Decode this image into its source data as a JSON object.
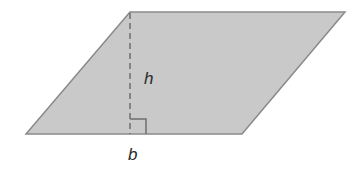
{
  "diagram": {
    "shape": "parallelogram",
    "vertices": [
      [
        130,
        12
      ],
      [
        345,
        12
      ],
      [
        242,
        134
      ],
      [
        26,
        134
      ]
    ],
    "fill_color": "#c9c9c9",
    "stroke_color": "#8a8a8a",
    "height_line": {
      "x": 130,
      "y1": 12,
      "y2": 134,
      "style": "dashed"
    },
    "right_angle_marker": {
      "x": 130,
      "y": 119,
      "size": 16
    },
    "labels": {
      "height": "h",
      "base": "b"
    }
  }
}
